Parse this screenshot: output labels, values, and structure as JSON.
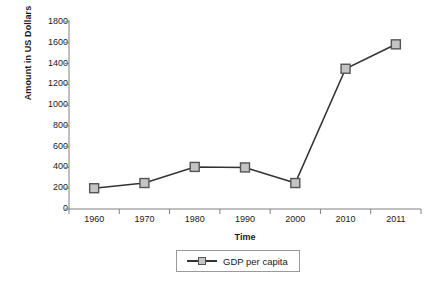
{
  "chart_data": {
    "type": "line",
    "title": "",
    "xlabel": "Time",
    "ylabel": "Amount in US Dollars",
    "categories": [
      "1960",
      "1970",
      "1980",
      "1990",
      "2000",
      "2010",
      "2011"
    ],
    "series": [
      {
        "name": "GDP per capita",
        "values": [
          200,
          250,
          405,
          400,
          250,
          1350,
          1585
        ]
      }
    ],
    "ylim": [
      0,
      1800
    ],
    "ytick_step": 200,
    "yticks": [
      "0",
      "200",
      "400",
      "600",
      "800",
      "1000",
      "1200",
      "1400",
      "1600",
      "1800"
    ],
    "grid": false,
    "legend_position": "bottom",
    "legend_entries": [
      "GDP per capita"
    ],
    "colors": {
      "line": "#333333",
      "marker_fill": "#c4c4c4",
      "marker_border": "#555555",
      "axis": "#808080",
      "text": "#1a1a1a"
    }
  }
}
